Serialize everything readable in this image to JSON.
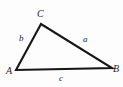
{
  "figure": {
    "kind": "geometry-diagram",
    "shape": "triangle",
    "background_color": "#fdfdfd",
    "stroke_color": "#161616",
    "label_color": "#1c1c1c",
    "stroke_width": 2.1,
    "vertices": [
      {
        "name": "A",
        "label": "A",
        "x": 16,
        "y": 70
      },
      {
        "name": "B",
        "label": "B",
        "x": 112,
        "y": 68
      },
      {
        "name": "C",
        "label": "C",
        "x": 41,
        "y": 24
      }
    ],
    "sides": [
      {
        "name": "a",
        "label": "a",
        "from": "C",
        "to": "B",
        "label_x": 86,
        "label_y": 40
      },
      {
        "name": "b",
        "label": "b",
        "from": "A",
        "to": "C",
        "label_x": 22,
        "label_y": 39
      },
      {
        "name": "c",
        "label": "c",
        "from": "A",
        "to": "B",
        "label_x": 62,
        "label_y": 79
      }
    ],
    "polygon_points": "16,70 41,24 112,68"
  }
}
